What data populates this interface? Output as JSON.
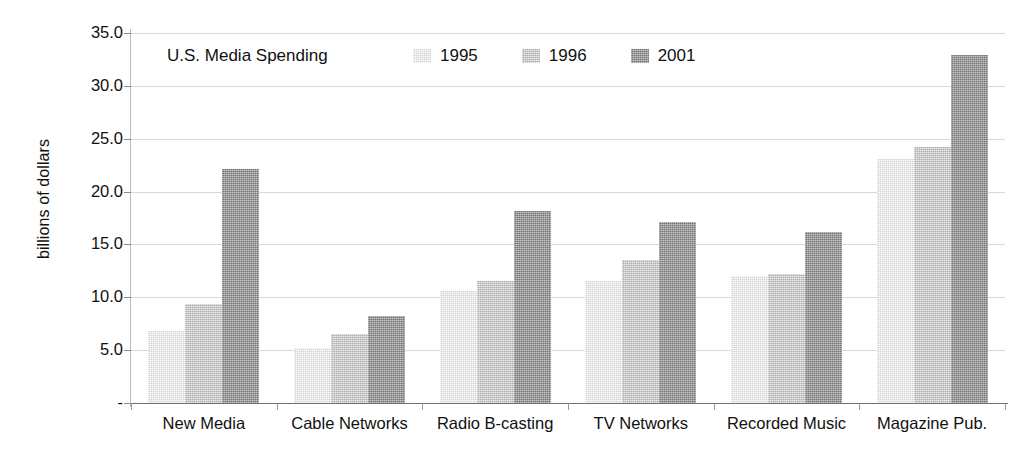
{
  "chart_data": {
    "type": "bar",
    "title": "U.S. Media Spending",
    "xlabel": "",
    "ylabel": "billions of dollars",
    "ylim": [
      0,
      35
    ],
    "ytick_labels": [
      "35.0",
      "30.0",
      "25.0",
      "20.0",
      "15.0",
      "10.0",
      "5.0",
      "-"
    ],
    "ytick_values": [
      35,
      30,
      25,
      20,
      15,
      10,
      5,
      0
    ],
    "grid": true,
    "legend_position": "top-inside",
    "categories": [
      "New Media",
      "Cable Networks",
      "Radio B-casting",
      "TV Networks",
      "Recorded Music",
      "Magazine Pub."
    ],
    "series": [
      {
        "name": "1995",
        "color": "#e2e2e2",
        "values": [
          6.8,
          5.2,
          10.6,
          11.5,
          12.0,
          23.1
        ]
      },
      {
        "name": "1996",
        "color": "#bfbfbf",
        "values": [
          9.4,
          6.5,
          11.5,
          13.5,
          12.2,
          24.2
        ]
      },
      {
        "name": "2001",
        "color": "#8b8b8b",
        "values": [
          22.1,
          8.2,
          18.2,
          17.1,
          16.2,
          32.9
        ]
      }
    ]
  },
  "artifacts": {
    "top": "",
    "bottom": ""
  }
}
